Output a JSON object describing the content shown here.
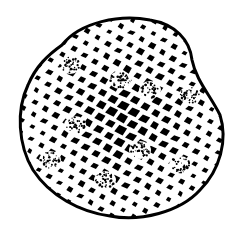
{
  "image": {
    "subject": "reticulate pollen grain illustration",
    "description": "Black-and-white stippled drawing of a rounded, slightly triangular spore/pollen grain with a net-like (reticulate) surface of dark polygonal lumina separated by white muri, with a few stippled patches.",
    "colors": {
      "background": "#ffffff",
      "ink": "#000000",
      "muri": "#ffffff"
    }
  }
}
